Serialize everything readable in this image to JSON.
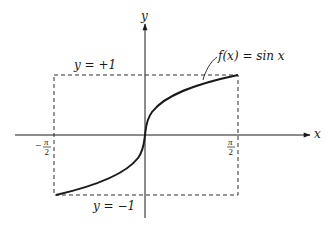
{
  "figure": {
    "axes": {
      "x_label": "x",
      "y_label": "y"
    },
    "labels": {
      "upper_bound": "y = +1",
      "lower_bound": "y = −1",
      "function": "f(x) = sin x",
      "x_min_sign": "−",
      "x_min_num": "π",
      "x_min_den": "2",
      "x_max_num": "π",
      "x_max_den": "2"
    },
    "colors": {
      "stroke": "#1a1a1a",
      "background": "#ffffff"
    }
  }
}
